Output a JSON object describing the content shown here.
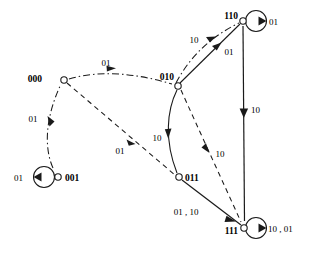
{
  "diagram": {
    "type": "directed-graph",
    "width": 309,
    "height": 253,
    "background_color": "#ffffff",
    "stroke_color": "#1a1a1a",
    "nodes": [
      {
        "id": "n000",
        "label": "000",
        "x": 64,
        "y": 80,
        "r": 3.2,
        "label_dx": -22,
        "label_dy": 2,
        "self_loop": false
      },
      {
        "id": "n001",
        "label": "001",
        "x": 58,
        "y": 177,
        "r": 3.2,
        "label_dx": 7,
        "label_dy": 4,
        "self_loop": true,
        "loop_cx": 44,
        "loop_cy": 177,
        "loop_r": 10.5,
        "loop_label": "01",
        "loop_label_x": 14,
        "loop_label_y": 181
      },
      {
        "id": "n010",
        "label": "010",
        "x": 178,
        "y": 86,
        "r": 3.2,
        "label_dx": -26,
        "label_dy": -6,
        "self_loop": false
      },
      {
        "id": "n011",
        "label": "011",
        "x": 179,
        "y": 177,
        "r": 3.2,
        "label_dx": 6,
        "label_dy": 4,
        "self_loop": false
      },
      {
        "id": "n110",
        "label": "110",
        "x": 243,
        "y": 21,
        "r": 3.2,
        "label_dx": -28,
        "label_dy": -2,
        "self_loop": true,
        "loop_cx": 256,
        "loop_cy": 21,
        "loop_r": 10.5,
        "loop_label": "01",
        "loop_label_x": 270,
        "loop_label_y": 25
      },
      {
        "id": "n111",
        "label": "111",
        "x": 244,
        "y": 228,
        "r": 3.2,
        "label_dx": -29,
        "label_dy": 6,
        "self_loop": true,
        "loop_cx": 256,
        "loop_cy": 228,
        "loop_r": 10.5,
        "loop_label": "10 , 01",
        "loop_label_x": 269,
        "loop_label_y": 232
      }
    ],
    "edges": [
      {
        "id": "e000-010",
        "from": "000",
        "to": "010",
        "label": "01",
        "style": "dashdot",
        "label_x": 106,
        "label_y": 66
      },
      {
        "id": "e001-000",
        "from": "001",
        "to": "000",
        "label": "01",
        "style": "dashdot",
        "label_x": 33,
        "label_y": 122
      },
      {
        "id": "e000-011",
        "from": "000",
        "to": "011",
        "label": "01",
        "style": "dashed",
        "label_x": 120,
        "label_y": 152
      },
      {
        "id": "e010-110a",
        "from": "010",
        "to": "110",
        "label": "10",
        "style": "dashdot",
        "label_x": 195,
        "label_y": 42
      },
      {
        "id": "e010-110b",
        "from": "010",
        "to": "110",
        "label": "01",
        "style": "solid",
        "label_x": 228,
        "label_y": 51
      },
      {
        "id": "e010-011",
        "from": "010",
        "to": "011",
        "label": "10",
        "style": "solid",
        "label_x": 158,
        "label_y": 139
      },
      {
        "id": "e010-111",
        "from": "010",
        "to": "111",
        "label": "10",
        "style": "dashed",
        "label_x": 219,
        "label_y": 157
      },
      {
        "id": "e110-111",
        "from": "110",
        "to": "111",
        "label": "10",
        "style": "solid",
        "label_x": 248,
        "label_y": 113
      },
      {
        "id": "e011-111",
        "from": "011",
        "to": "111",
        "label": "01 , 10",
        "style": "solid",
        "label_x": 186,
        "label_y": 215
      }
    ]
  }
}
